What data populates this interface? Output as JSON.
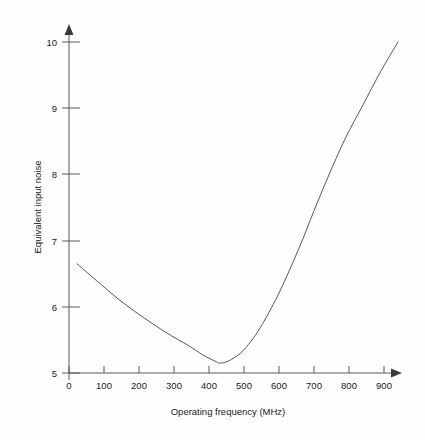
{
  "chart_data": {
    "type": "line",
    "title": "",
    "xlabel": "Operating frequency (MHz)",
    "ylabel": "Equivalent input noise",
    "xlim": [
      0,
      950
    ],
    "ylim": [
      5,
      10
    ],
    "xticks": [
      0,
      100,
      200,
      300,
      400,
      500,
      600,
      700,
      800,
      900
    ],
    "xtick_labels": [
      "0",
      "100",
      "200",
      "300",
      "400",
      "500",
      "600",
      "700",
      "800",
      "900"
    ],
    "yticks": [
      5,
      6,
      7,
      8,
      9,
      10
    ],
    "ytick_labels": [
      "5",
      "6",
      "7",
      "8",
      "9",
      "10"
    ],
    "grid": false,
    "legend": "none",
    "series": [
      {
        "name": "Equivalent input noise",
        "x": [
          23,
          60,
          100,
          140,
          188,
          240,
          290,
          340,
          380,
          417,
          430,
          455,
          490,
          520,
          546,
          580,
          610,
          660,
          700,
          740,
          790,
          840,
          890,
          940
        ],
        "y": [
          6.65,
          6.48,
          6.3,
          6.12,
          5.93,
          5.74,
          5.57,
          5.42,
          5.28,
          5.18,
          5.15,
          5.18,
          5.3,
          5.48,
          5.68,
          6.0,
          6.32,
          6.92,
          7.45,
          7.96,
          8.55,
          9.05,
          9.55,
          10.0
        ]
      }
    ],
    "annotations": [],
    "x_axis_arrow": true,
    "y_axis_arrow": true,
    "colors": {
      "curve": "#555555",
      "axis": "#5a5a5a",
      "text": "#1a1a1a",
      "background": "#fefefe"
    }
  },
  "axes": {
    "x_title": "Operating frequency (MHz)",
    "y_title": "Equivalent input noise"
  }
}
